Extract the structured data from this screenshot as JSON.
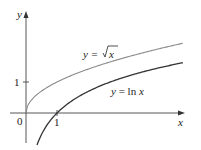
{
  "chart_data": {
    "type": "line",
    "title": "",
    "xlabel": "x",
    "ylabel": "y",
    "x_ticks": [
      {
        "value": 0,
        "label": "0"
      },
      {
        "value": 1,
        "label": "1"
      }
    ],
    "y_ticks": [
      {
        "value": 1,
        "label": "1"
      }
    ],
    "xlim": [
      -0.5,
      5.1
    ],
    "ylim": [
      -1.0,
      3.2
    ],
    "grid": false,
    "series": [
      {
        "name": "y = √x",
        "function": "sqrt(x)",
        "color": "#8a8a8a",
        "x": [
          0,
          0.25,
          0.5,
          1,
          2,
          3,
          4,
          5
        ],
        "values": [
          0,
          0.5,
          0.71,
          1,
          1.41,
          1.73,
          2,
          2.24
        ]
      },
      {
        "name": "y = ln x",
        "function": "ln(x)",
        "color": "#333333",
        "x": [
          0.35,
          0.5,
          1,
          2,
          3,
          4,
          5
        ],
        "values": [
          -1.05,
          -0.69,
          0,
          0.69,
          1.1,
          1.39,
          1.61
        ]
      }
    ],
    "annotations": [
      {
        "text": "y = √x",
        "near_series": 0
      },
      {
        "text": "y = ln x",
        "near_series": 1
      }
    ]
  },
  "labels": {
    "y_axis": "y",
    "x_axis": "x",
    "origin": "0",
    "x_tick_1": "1",
    "y_tick_1": "1",
    "sqrt_prefix": "y = ",
    "sqrt_arg": "x",
    "ln_label_prefix": "y = ln ",
    "ln_label_var": "x"
  }
}
